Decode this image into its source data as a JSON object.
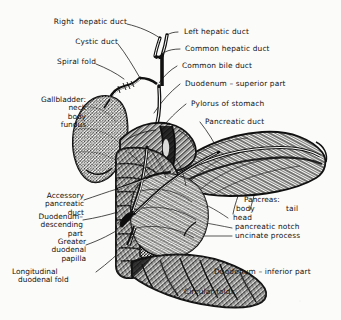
{
  "figure": {
    "style": "engraved line-art anatomical atlas plate",
    "ink_color": "#111111",
    "background_color": "#fbfbf9",
    "width": 341,
    "height": 320
  },
  "labels": {
    "right_hepatic_duct": "Right  hepatic duct",
    "cystic_duct": "Cystic duct",
    "spiral_fold": "Spiral fold",
    "left_hepatic_duct": "Left hepatic duct",
    "common_hepatic_duct": "Common hepatic duct",
    "common_bile_duct": "Common bile duct",
    "duodenum_superior_part": "Duodenum – superior part",
    "pylorus_of_stomach": "Pylorus of stomach",
    "pancreatic_duct": "Pancreatic duct",
    "duodenum_inferior_part": "Duodenum – inferior part",
    "circular_folds": "Circular folds"
  },
  "gallbladder_group": {
    "heading": "Gallbladder:",
    "parts": [
      "neck",
      "body",
      "fundus"
    ]
  },
  "accessory_pancreatic_duct_group": {
    "lines": [
      "Accessory",
      "pancreatic",
      "duct"
    ]
  },
  "duodenum_descending_group": {
    "lines": [
      "Duodenum–",
      "descending",
      "part"
    ]
  },
  "greater_duodenal_papilla_group": {
    "lines": [
      "Greater",
      "duodenal",
      "papilla"
    ]
  },
  "longitudinal_duodenal_fold_group": {
    "lines": [
      "Longitudinal",
      "duodenal fold"
    ]
  },
  "pancreas_group": {
    "heading": "Pancreas:",
    "body": "body",
    "tail": "tail",
    "head": "head",
    "pancreatic_notch": "pancreatic notch",
    "uncinate_process": "uncinate process"
  }
}
